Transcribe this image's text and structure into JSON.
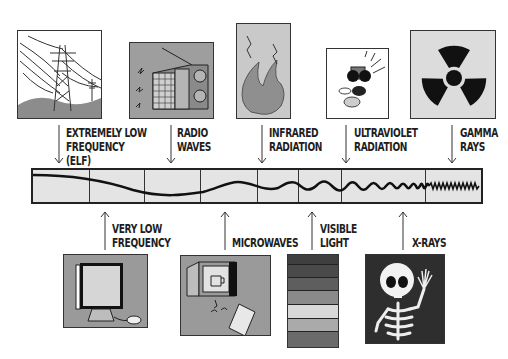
{
  "diagram": {
    "top_labels": [
      {
        "id": "elf",
        "lines": "EXTREMELY LOW\nFREQUENCY\n(ELF)",
        "icon": "power-line-tower-icon"
      },
      {
        "id": "radio",
        "lines": "RADIO\nWAVES",
        "icon": "radio-icon"
      },
      {
        "id": "infrared",
        "lines": "INFRARED\nRADIATION",
        "icon": "flame-icon"
      },
      {
        "id": "ultraviolet",
        "lines": "ULTRAVIOLET\nRADIATION",
        "icon": "sunglasses-bug-icon"
      },
      {
        "id": "gamma",
        "lines": "GAMMA\nRAYS",
        "icon": "radiation-symbol-icon"
      }
    ],
    "bottom_labels": [
      {
        "id": "vlf",
        "lines": "VERY LOW\nFREQUENCY",
        "icon": "computer-monitor-icon"
      },
      {
        "id": "microwaves",
        "lines": "MICROWAVES",
        "icon": "microwave-oven-phone-icon"
      },
      {
        "id": "visible",
        "lines": "VISIBLE\nLIGHT",
        "icon": "color-bands-icon"
      },
      {
        "id": "xrays",
        "lines": "X-RAYS",
        "icon": "skeleton-icon"
      }
    ],
    "spectrum_bar": {
      "segments": 8,
      "wave_description": "wavelength decreasing left to right (low to high frequency)"
    },
    "visible_light_bands": [
      "#3f3f3f",
      "#4a4a4a",
      "#5e5e5e",
      "#8a8a8a",
      "#d8d8d8",
      "#aaaaaa",
      "#6a6a6a"
    ],
    "colors": {
      "box_gray": "#a3a3a3",
      "box_light": "#dcdcdc",
      "dark": "#222222",
      "spectrum_fill": "#e4e4e4"
    }
  }
}
